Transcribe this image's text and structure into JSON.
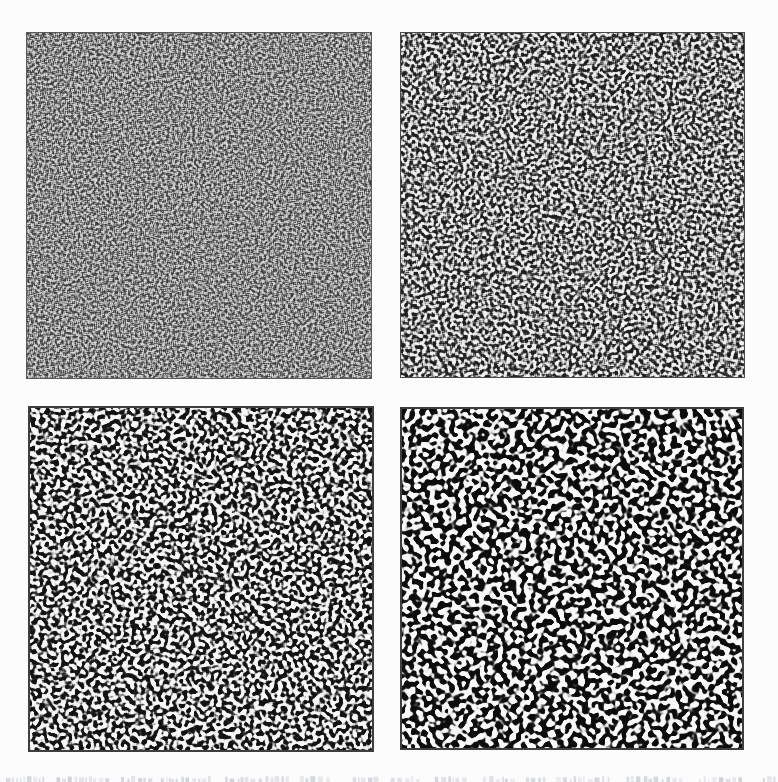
{
  "page": {
    "kind": "scanned paper figure page, cropped at bottom",
    "background_color": "#fcfcfd"
  },
  "figure": {
    "layout": "2x2 grid of square pattern snapshots",
    "pattern_type": "black-and-white labyrinthine coarsening texture (spinodal-decomposition-like), coarseness increasing from top-left to bottom-right",
    "panels": [
      {
        "id": "top-left",
        "coarseness": "finest",
        "contrast": "soft grayscale",
        "wavelength_px": 4.9,
        "seed": 101,
        "blur_small": 1,
        "blur_large": 3,
        "gain": 1.6,
        "bias": 0,
        "gray_low": 54,
        "gray_high": 222,
        "border_color": "#5a5a5a",
        "border_px": 1
      },
      {
        "id": "top-right",
        "coarseness": "fine",
        "contrast": "medium-high",
        "wavelength_px": 6.9,
        "seed": 202,
        "blur_small": 2,
        "blur_large": 6,
        "gain": 2.8,
        "bias": 0,
        "gray_low": 28,
        "gray_high": 243,
        "border_color": "#4a4a4a",
        "border_px": 1
      },
      {
        "id": "bottom-left",
        "coarseness": "coarse",
        "contrast": "high, near binary",
        "wavelength_px": 8.8,
        "seed": 303,
        "blur_small": 3,
        "blur_large": 10,
        "gain": 5,
        "bias": 0,
        "gray_low": 18,
        "gray_high": 248,
        "border_color": "#3e3e3e",
        "border_px": 2
      },
      {
        "id": "bottom-right",
        "coarseness": "coarsest",
        "contrast": "binary",
        "wavelength_px": 11.4,
        "seed": 404,
        "blur_small": 5,
        "blur_large": 17,
        "gain": 7,
        "bias": 0.06,
        "gray_low": 12,
        "gray_high": 250,
        "border_color": "#3e3e3e",
        "border_px": 2
      }
    ]
  },
  "caption": {
    "state": "caption line cut off by bottom edge; only faint tops of glyphs visible",
    "ink_color_rgb": [
      150,
      155,
      172
    ],
    "seed": 55
  }
}
